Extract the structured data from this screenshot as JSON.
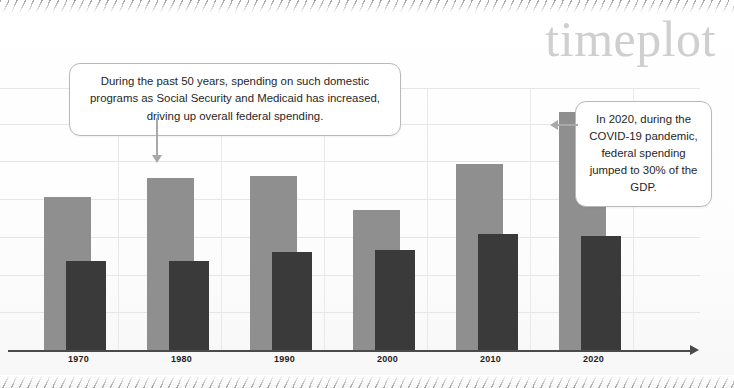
{
  "brand": {
    "name": "timeplot"
  },
  "watermark": {
    "ghost_line_1": "",
    "ghost_line_2": ""
  },
  "callouts": [
    {
      "id": "left",
      "text": "During the past 50 years, spending on such domestic programs as Social Security and Medicaid has increased, driving up overall federal spending.",
      "pointer": "arrow-down",
      "points_at": "1980"
    },
    {
      "id": "right",
      "text": "In 2020, during the COVID-19 pandemic, federal spending jumped to 30% of the GDP.",
      "pointer": "arrow-left",
      "points_at": "2020"
    }
  ],
  "colors": {
    "bar_light": "#8f8f8f",
    "bar_dark": "#3a3a3a",
    "axis": "#4b4b4b",
    "grid": "#e6e6e6",
    "brand": "#cfcfcf",
    "callout_border": "#b9b9b9"
  },
  "chart_data": {
    "type": "bar",
    "title": "",
    "subtitle": "",
    "xlabel": "",
    "ylabel": "",
    "categories": [
      "1970",
      "1980",
      "1990",
      "2000",
      "2010",
      "2020"
    ],
    "series": [
      {
        "name": "Total federal spending (% of GDP)",
        "color": "#8f8f8f",
        "values": [
          19.3,
          21.7,
          21.9,
          17.7,
          23.4,
          30.0
        ]
      },
      {
        "name": "Domestic program spending (% of GDP)",
        "color": "#3a3a3a",
        "values": [
          11.2,
          11.2,
          12.4,
          12.6,
          14.6,
          14.4
        ]
      }
    ],
    "ylim": [
      0,
      33
    ],
    "grid": true,
    "gridline_values": [
      4.8,
      9.5,
      14.3,
      19.0,
      23.8,
      28.5,
      33.0
    ],
    "legend": "none",
    "annotations": [
      "During the past 50 years, spending on such domestic programs as Social Security and Medicaid has increased, driving up overall federal spending.",
      "In 2020, during the COVID-19 pandemic, federal spending jumped to 30% of the GDP."
    ]
  }
}
